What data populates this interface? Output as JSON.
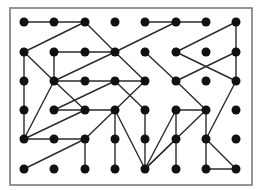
{
  "puzzle": {
    "type": "dot-grid-connections",
    "columns": 8,
    "rows": 6,
    "frame": {
      "x": 10,
      "y": 8,
      "width": 242,
      "height": 177
    },
    "col_x": [
      24,
      54,
      85,
      115,
      145,
      176,
      206,
      236
    ],
    "row_y": [
      22,
      52,
      81,
      110,
      139,
      169
    ],
    "dot_radius": 4.5,
    "colors": {
      "dot": "#111111",
      "line": "#2b2b2b",
      "frame": "#7a7a7a",
      "background": "#ffffff"
    },
    "edges": [
      [
        [
          0,
          0
        ],
        [
          1,
          0
        ]
      ],
      [
        [
          1,
          0
        ],
        [
          2,
          0
        ]
      ],
      [
        [
          4,
          0
        ],
        [
          5,
          0
        ]
      ],
      [
        [
          5,
          0
        ],
        [
          6,
          0
        ]
      ],
      [
        [
          2,
          0
        ],
        [
          0,
          1
        ]
      ],
      [
        [
          2,
          0
        ],
        [
          3,
          1
        ]
      ],
      [
        [
          5,
          0
        ],
        [
          3,
          1
        ]
      ],
      [
        [
          7,
          0
        ],
        [
          5,
          1
        ]
      ],
      [
        [
          7,
          0
        ],
        [
          7,
          1
        ]
      ],
      [
        [
          1,
          1
        ],
        [
          2,
          1
        ]
      ],
      [
        [
          2,
          1
        ],
        [
          3,
          1
        ]
      ],
      [
        [
          1,
          1
        ],
        [
          1,
          2
        ]
      ],
      [
        [
          0,
          1
        ],
        [
          0,
          2
        ]
      ],
      [
        [
          0,
          1
        ],
        [
          1,
          2
        ]
      ],
      [
        [
          3,
          1
        ],
        [
          1,
          2
        ]
      ],
      [
        [
          3,
          1
        ],
        [
          4,
          2
        ]
      ],
      [
        [
          4,
          1
        ],
        [
          5,
          2
        ]
      ],
      [
        [
          5,
          1
        ],
        [
          7,
          2
        ]
      ],
      [
        [
          7,
          1
        ],
        [
          5,
          2
        ]
      ],
      [
        [
          7,
          1
        ],
        [
          7,
          2
        ]
      ],
      [
        [
          0,
          2
        ],
        [
          0,
          3
        ]
      ],
      [
        [
          1,
          2
        ],
        [
          2,
          2
        ]
      ],
      [
        [
          2,
          2
        ],
        [
          3,
          2
        ]
      ],
      [
        [
          3,
          2
        ],
        [
          4,
          2
        ]
      ],
      [
        [
          1,
          2
        ],
        [
          2,
          3
        ]
      ],
      [
        [
          1,
          2
        ],
        [
          0,
          4
        ]
      ],
      [
        [
          3,
          2
        ],
        [
          1,
          3
        ]
      ],
      [
        [
          3,
          2
        ],
        [
          4,
          3
        ]
      ],
      [
        [
          4,
          2
        ],
        [
          3,
          3
        ]
      ],
      [
        [
          5,
          2
        ],
        [
          6,
          3
        ]
      ],
      [
        [
          7,
          2
        ],
        [
          6,
          4
        ]
      ],
      [
        [
          1,
          3
        ],
        [
          2,
          3
        ]
      ],
      [
        [
          2,
          3
        ],
        [
          3,
          3
        ]
      ],
      [
        [
          0,
          3
        ],
        [
          0,
          4
        ]
      ],
      [
        [
          2,
          3
        ],
        [
          0,
          4
        ]
      ],
      [
        [
          3,
          3
        ],
        [
          2,
          4
        ]
      ],
      [
        [
          3,
          3
        ],
        [
          3,
          4
        ]
      ],
      [
        [
          3,
          3
        ],
        [
          4,
          5
        ]
      ],
      [
        [
          4,
          3
        ],
        [
          4,
          4
        ]
      ],
      [
        [
          5,
          3
        ],
        [
          6,
          3
        ]
      ],
      [
        [
          5,
          3
        ],
        [
          4,
          5
        ]
      ],
      [
        [
          5,
          3
        ],
        [
          5,
          4
        ]
      ],
      [
        [
          6,
          3
        ],
        [
          4,
          5
        ]
      ],
      [
        [
          6,
          3
        ],
        [
          6,
          4
        ]
      ],
      [
        [
          0,
          4
        ],
        [
          1,
          4
        ]
      ],
      [
        [
          1,
          4
        ],
        [
          2,
          4
        ]
      ],
      [
        [
          2,
          4
        ],
        [
          0,
          5
        ]
      ],
      [
        [
          2,
          4
        ],
        [
          2,
          5
        ]
      ],
      [
        [
          3,
          4
        ],
        [
          3,
          5
        ]
      ],
      [
        [
          4,
          4
        ],
        [
          4,
          5
        ]
      ],
      [
        [
          5,
          4
        ],
        [
          4,
          5
        ]
      ],
      [
        [
          5,
          4
        ],
        [
          5,
          5
        ]
      ],
      [
        [
          6,
          4
        ],
        [
          6,
          5
        ]
      ],
      [
        [
          6,
          4
        ],
        [
          7,
          5
        ]
      ],
      [
        [
          6,
          5
        ],
        [
          7,
          5
        ]
      ]
    ]
  }
}
